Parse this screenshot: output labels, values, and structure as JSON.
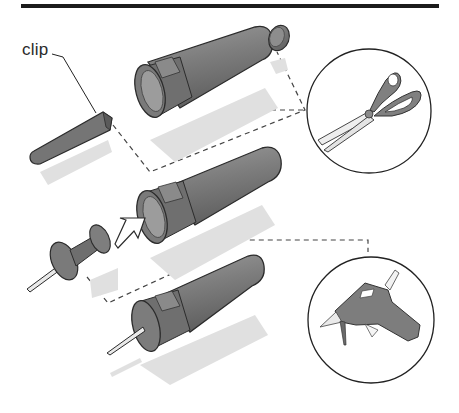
{
  "figure": {
    "labels": {
      "clip": "clip"
    },
    "colors": {
      "rule": "#1c1c1c",
      "part_fill": "#7d7d7d",
      "part_dark": "#5e5e5e",
      "part_light": "#9a9a9a",
      "outline": "#2b2b2b",
      "shadow": "#e2e2e2",
      "dashed_leader": "#444444",
      "callout_circle": "#222222",
      "metal": "#e9e9e9"
    },
    "steps": [
      {
        "name": "marker-cap-removed-with-clip",
        "parts": [
          "marker-barrel",
          "marker-end-cap",
          "marker-clip"
        ]
      },
      {
        "name": "insert-pushpin",
        "parts": [
          "marker-barrel",
          "pushpin",
          "insert-arrow"
        ]
      },
      {
        "name": "assembled-tool",
        "parts": [
          "marker-barrel",
          "pushpin-needle"
        ]
      }
    ],
    "tools": [
      {
        "name": "scissors"
      },
      {
        "name": "glue-gun"
      }
    ]
  }
}
